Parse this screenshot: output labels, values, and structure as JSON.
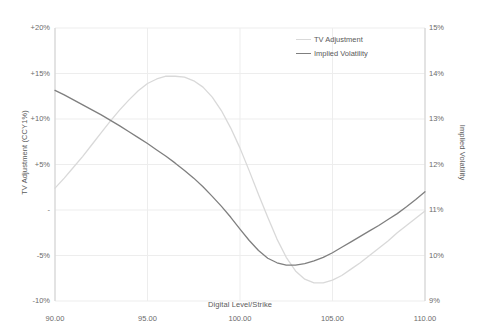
{
  "chart_data": {
    "type": "line",
    "title": "",
    "xlabel": "Digital Level/Strike",
    "ylabel": "TV Adjustment (CCY1%)",
    "y2label": "Implied Volatility",
    "xlim": [
      90,
      110
    ],
    "ylim": [
      -10,
      20
    ],
    "y2lim": [
      9,
      15
    ],
    "grid": true,
    "legend_position": "top-right",
    "x_ticks": [
      "90.00",
      "95.00",
      "100.00",
      "105.00",
      "110.00"
    ],
    "x_tick_values": [
      90,
      95,
      100,
      105,
      110
    ],
    "y_left_ticks": [
      "+20%",
      "+15%",
      "+10%",
      "+5%",
      "-",
      "-5%",
      "-10%"
    ],
    "y_left_tick_values": [
      20,
      15,
      10,
      5,
      0,
      -5,
      -10
    ],
    "y_right_ticks": [
      "15%",
      "14%",
      "13%",
      "12%",
      "11%",
      "10%",
      "9%"
    ],
    "y_right_tick_values": [
      15,
      14,
      13,
      12,
      11,
      10,
      9
    ],
    "series": [
      {
        "name": "TV Adjustment",
        "axis": "left",
        "color": "#d9d9d9",
        "x": [
          90.0,
          90.5,
          91.0,
          91.5,
          92.0,
          92.5,
          93.0,
          93.5,
          94.0,
          94.5,
          95.0,
          95.5,
          96.0,
          96.5,
          97.0,
          97.5,
          98.0,
          98.5,
          99.0,
          99.5,
          100.0,
          100.5,
          101.0,
          101.5,
          102.0,
          102.5,
          103.0,
          103.5,
          104.0,
          104.5,
          105.0,
          105.5,
          106.0,
          106.5,
          107.0,
          107.5,
          108.0,
          108.5,
          109.0,
          109.5,
          110.0
        ],
        "values": [
          2.4,
          3.5,
          4.7,
          5.9,
          7.2,
          8.5,
          9.8,
          11.0,
          12.1,
          13.1,
          13.9,
          14.4,
          14.7,
          14.7,
          14.6,
          14.2,
          13.5,
          12.4,
          10.9,
          9.0,
          6.8,
          4.3,
          1.7,
          -0.8,
          -3.2,
          -5.2,
          -6.7,
          -7.6,
          -8.0,
          -8.0,
          -7.7,
          -7.2,
          -6.5,
          -5.8,
          -5.0,
          -4.2,
          -3.4,
          -2.5,
          -1.7,
          -0.9,
          -0.1
        ]
      },
      {
        "name": "Implied Volatility",
        "axis": "right",
        "color": "#7f7f7f",
        "x": [
          90.0,
          90.5,
          91.0,
          91.5,
          92.0,
          92.5,
          93.0,
          93.5,
          94.0,
          94.5,
          95.0,
          95.5,
          96.0,
          96.5,
          97.0,
          97.5,
          98.0,
          98.5,
          99.0,
          99.5,
          100.0,
          100.5,
          101.0,
          101.5,
          102.0,
          102.5,
          103.0,
          103.5,
          104.0,
          104.5,
          105.0,
          105.5,
          106.0,
          106.5,
          107.0,
          107.5,
          108.0,
          108.5,
          109.0,
          109.5,
          110.0
        ],
        "values": [
          13.63,
          13.53,
          13.42,
          13.31,
          13.2,
          13.09,
          12.97,
          12.85,
          12.72,
          12.59,
          12.46,
          12.32,
          12.18,
          12.03,
          11.87,
          11.7,
          11.51,
          11.3,
          11.08,
          10.84,
          10.58,
          10.33,
          10.11,
          9.94,
          9.84,
          9.79,
          9.79,
          9.82,
          9.88,
          9.96,
          10.06,
          10.18,
          10.3,
          10.42,
          10.54,
          10.66,
          10.79,
          10.92,
          11.07,
          11.23,
          11.4
        ]
      }
    ]
  },
  "legend": {
    "items": [
      {
        "label": "TV Adjustment",
        "color": "#d9d9d9"
      },
      {
        "label": "Implied Volatility",
        "color": "#7f7f7f"
      }
    ]
  }
}
